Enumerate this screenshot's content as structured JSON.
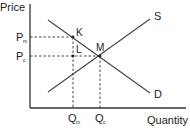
{
  "diagram": {
    "type": "supply-demand-monopoly",
    "axes": {
      "y_label": "Price",
      "x_label": "Quantity"
    },
    "curves": [
      {
        "id": "supply",
        "label": "S"
      },
      {
        "id": "demand",
        "label": "D"
      }
    ],
    "price_levels": [
      {
        "id": "monopoly",
        "label": "P",
        "subscript": "m"
      },
      {
        "id": "competitive",
        "label": "P",
        "subscript": "c"
      }
    ],
    "quantity_levels": [
      {
        "id": "monopoly",
        "label": "Q",
        "subscript": "m"
      },
      {
        "id": "competitive",
        "label": "Q",
        "subscript": "c"
      }
    ],
    "points": [
      {
        "id": "K",
        "label": "K"
      },
      {
        "id": "L",
        "label": "L"
      },
      {
        "id": "M",
        "label": "M"
      }
    ],
    "colors": {
      "line": "#444444",
      "axis": "#333333",
      "text": "#222222",
      "background": "#ffffff"
    }
  }
}
